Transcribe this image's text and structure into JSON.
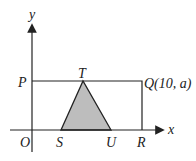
{
  "diagram": {
    "axes": {
      "x_label": "x",
      "y_label": "y",
      "origin_label": "O"
    },
    "points": {
      "P": "P",
      "T": "T",
      "Q": "Q(10, a)",
      "S": "S",
      "U": "U",
      "R": "R"
    },
    "colors": {
      "line": "#222222",
      "fill": "#bdbdbd"
    }
  }
}
